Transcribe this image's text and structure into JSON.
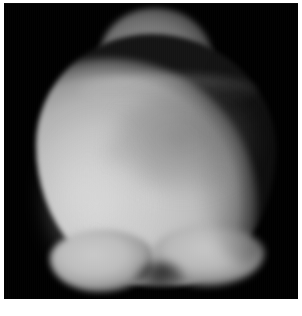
{
  "figure": {
    "alt_name": "grayscale-imaged-body",
    "frame_background": "#000000",
    "page_background": "#ffffff",
    "border_color": "#ffffff"
  },
  "subject": {
    "name": "rounded-body-silhouette",
    "description": "large bright rounded object against black background with a smaller darker lobe protruding at top and two lobes along the lower edge",
    "brightest_tone": "#d2d2d2",
    "midtone": "#b2b2b2",
    "top_lobe_tone": "#6d6d6d",
    "shadow_tone": "#000000"
  },
  "caption": {
    "text": "",
    "visible": false,
    "note": "clipped at bottom edge of screenshot"
  }
}
